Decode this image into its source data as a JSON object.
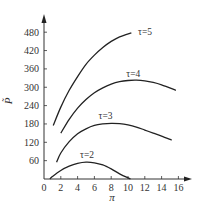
{
  "chart_data": {
    "type": "line",
    "title": "",
    "xlabel": "π",
    "ylabel": "P̃",
    "xlim": [
      0,
      17.5
    ],
    "ylim": [
      0,
      520
    ],
    "xticks": [
      0,
      2,
      4,
      6,
      8,
      10,
      12,
      14,
      16
    ],
    "yticks": [
      60,
      120,
      180,
      240,
      300,
      360,
      420,
      480
    ],
    "x_tick_labels": [
      "0",
      "2",
      "4",
      "6",
      "8",
      "10",
      "12",
      "14",
      "16"
    ],
    "y_tick_labels": [
      "60",
      "120",
      "180",
      "240",
      "300",
      "360",
      "420",
      "480"
    ],
    "grid": false,
    "legend": "inline curve labels",
    "series": [
      {
        "name": "τ=5",
        "label": "τ=5",
        "x": [
          1.1,
          2,
          3,
          4,
          5,
          6,
          7,
          8,
          9,
          10.4
        ],
        "y": [
          175,
          235,
          290,
          335,
          375,
          405,
          430,
          450,
          465,
          478
        ],
        "label_pos": [
          11.2,
          472
        ]
      },
      {
        "name": "τ=4",
        "label": "τ=4",
        "x": [
          2,
          3,
          4,
          5,
          6,
          7,
          8,
          9,
          10,
          11,
          12,
          13,
          14,
          15.7
        ],
        "y": [
          150,
          195,
          232,
          260,
          282,
          298,
          310,
          318,
          322,
          323,
          321,
          316,
          308,
          290
        ],
        "label_pos": [
          9.8,
          335
        ]
      },
      {
        "name": "τ=3",
        "label": "τ=3",
        "x": [
          1.5,
          2,
          3,
          4,
          5,
          6,
          7,
          8,
          9,
          10,
          11,
          12,
          13,
          14,
          15.2
        ],
        "y": [
          55,
          85,
          122,
          148,
          164,
          175,
          180,
          182,
          181,
          177,
          170,
          160,
          150,
          140,
          127
        ],
        "label_pos": [
          6.5,
          195
        ]
      },
      {
        "name": "τ=2",
        "label": "τ=2",
        "x": [
          0.7,
          1,
          2,
          3,
          4,
          5,
          6,
          7,
          8,
          9,
          10.3
        ],
        "y": [
          0,
          8,
          28,
          42,
          51,
          55,
          53,
          46,
          33,
          17,
          0
        ],
        "label_pos": [
          4.3,
          68
        ]
      }
    ]
  }
}
